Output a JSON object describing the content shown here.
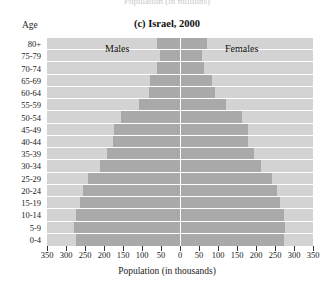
{
  "cropped_caption_above": "Population (in millions)",
  "figure": {
    "title": "(c) Israel, 2000",
    "y_axis_title": "Age",
    "x_axis_title": "Population (in thousands)",
    "male_series_label": "Males",
    "female_series_label": "Females"
  },
  "chart_data": {
    "type": "bar",
    "subtype": "population-pyramid",
    "title": "(c) Israel, 2000",
    "xlabel": "Population (in thousands)",
    "ylabel": "Age",
    "xlim": [
      -350,
      350
    ],
    "x_ticks": [
      -350,
      -300,
      -250,
      -200,
      -150,
      -100,
      -50,
      0,
      50,
      100,
      150,
      200,
      250,
      300,
      350
    ],
    "x_tick_labels": [
      "350",
      "300",
      "250",
      "200",
      "150",
      "100",
      "50",
      "0",
      "50",
      "100",
      "150",
      "200",
      "250",
      "300",
      "350"
    ],
    "grid": false,
    "legend_position": "in-plot",
    "categories": [
      "80+",
      "75-79",
      "70-74",
      "65-69",
      "60-64",
      "55-59",
      "50-54",
      "45-49",
      "40-44",
      "35-39",
      "30-34",
      "25-29",
      "20-24",
      "15-19",
      "10-14",
      "5-9",
      "0-4"
    ],
    "series": [
      {
        "name": "Males",
        "direction": "left",
        "values": [
          60,
          53,
          60,
          78,
          82,
          108,
          155,
          175,
          177,
          191,
          210,
          242,
          255,
          262,
          275,
          278,
          275
        ]
      },
      {
        "name": "Females",
        "direction": "right",
        "values": [
          70,
          58,
          62,
          85,
          92,
          120,
          162,
          180,
          178,
          194,
          212,
          243,
          256,
          263,
          274,
          277,
          274
        ]
      }
    ],
    "colors": {
      "bar": "#a9a9a9",
      "plot_background": "#d3d3d3",
      "centerline": "#ffffff",
      "text": "#1a1a1a"
    }
  }
}
